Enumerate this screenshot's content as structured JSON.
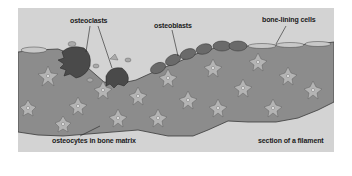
{
  "diagram": {
    "labels": {
      "osteoclasts": "osteoclasts",
      "osteoblasts": "osteoblasts",
      "bone_lining_cells": "bone-lining cells",
      "osteocytes": "osteocytes in bone matrix",
      "caption": "section of a filament"
    },
    "colors": {
      "background": "#d3d3d3",
      "matrix": "#8c8c8c",
      "matrix_outline": "#3a3a3a",
      "osteocyte": "#b4b4b4",
      "osteoclast": "#4a4a4a",
      "osteoblast": "#6a6a6a",
      "lining_cell": "#c8c8c8"
    }
  }
}
